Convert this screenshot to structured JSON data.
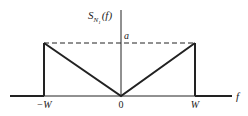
{
  "diagram": {
    "y_axis_label": {
      "main": "S",
      "sub": "N",
      "subsub": "1",
      "arg": "(f)"
    },
    "x_axis_label": "f",
    "level_label": "a",
    "ticks": [
      {
        "label": "−W",
        "value": "-W"
      },
      {
        "label": "0",
        "value": "0"
      },
      {
        "label": "W",
        "value": "W"
      }
    ],
    "shape": "V-shaped spectrum: zero at f=0, rising linearly to a at |f|=W, zero outside [-W, W]",
    "colors": {
      "ink": "#222222",
      "background": "#ffffff"
    }
  }
}
